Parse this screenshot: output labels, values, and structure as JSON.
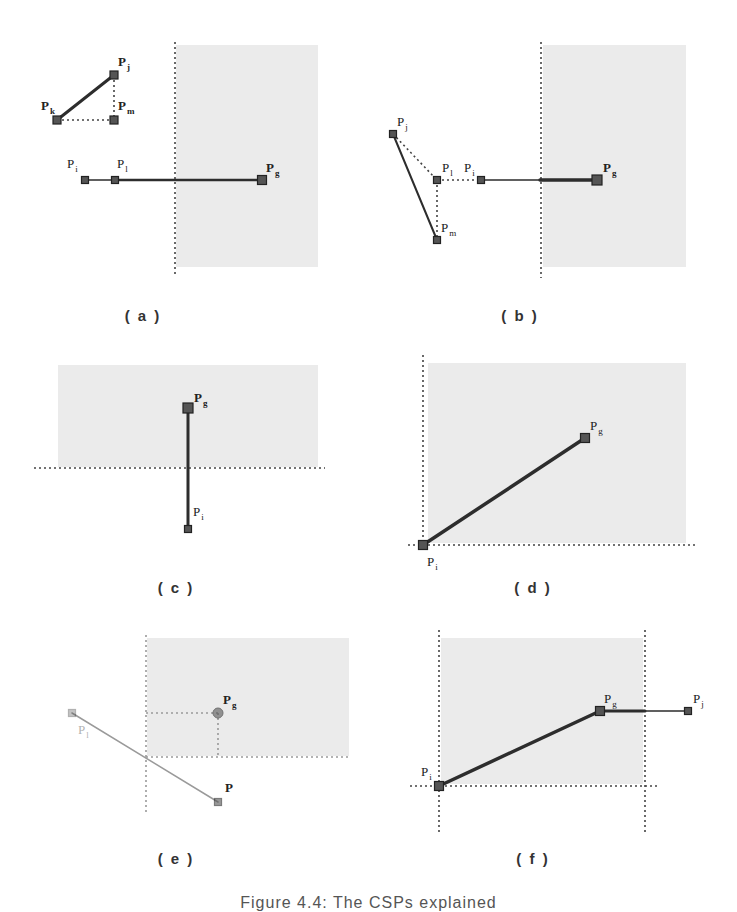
{
  "figure": {
    "caption": "Figure 4.4: The CSPs explained",
    "colors": {
      "region_fill": "#ebebeb",
      "line": "#2d2d2d",
      "point_fill": "#555555",
      "point_stroke": "#222222",
      "dotted": "#444444",
      "faded": "#9a9a9a"
    },
    "panels": [
      {
        "id": "a",
        "label": "( a )",
        "label_pos": [
          143,
          319
        ],
        "regions": [
          {
            "x": 176,
            "y": 45,
            "w": 142,
            "h": 222
          }
        ],
        "dotted_lines": [
          {
            "x1": 175,
            "y1": 42,
            "x2": 175,
            "y2": 275
          },
          {
            "x1": 57,
            "y1": 120,
            "x2": 114,
            "y2": 120
          },
          {
            "x1": 114,
            "y1": 75,
            "x2": 114,
            "y2": 120
          }
        ],
        "solid_lines": [
          {
            "x1": 57,
            "y1": 120,
            "x2": 114,
            "y2": 75,
            "w": 3
          },
          {
            "x1": 85,
            "y1": 180,
            "x2": 115,
            "y2": 180,
            "w": 1.5
          },
          {
            "x1": 115,
            "y1": 180,
            "x2": 262,
            "y2": 180,
            "w": 2.5
          }
        ],
        "points": [
          {
            "name": "Pk",
            "x": 57,
            "y": 120,
            "s": 8,
            "label": "P",
            "sub": "k",
            "lx": 41,
            "ly": 110,
            "bold": true
          },
          {
            "name": "Pj",
            "x": 114,
            "y": 75,
            "s": 8,
            "label": "P",
            "sub": "j",
            "lx": 118,
            "ly": 66,
            "bold": true
          },
          {
            "name": "Pm",
            "x": 114,
            "y": 120,
            "s": 8,
            "label": "P",
            "sub": "m",
            "lx": 118,
            "ly": 110,
            "bold": true
          },
          {
            "name": "Pi",
            "x": 85,
            "y": 180,
            "s": 7,
            "label": "P",
            "sub": "i",
            "lx": 67,
            "ly": 168,
            "bold": false
          },
          {
            "name": "Pl",
            "x": 115,
            "y": 180,
            "s": 7,
            "label": "P",
            "sub": "l",
            "lx": 117,
            "ly": 168,
            "bold": false
          },
          {
            "name": "Pg",
            "x": 262,
            "y": 180,
            "s": 9,
            "label": "P",
            "sub": "g",
            "lx": 266,
            "ly": 172,
            "bold": true
          }
        ]
      },
      {
        "id": "b",
        "label": "( b )",
        "label_pos": [
          520,
          319
        ],
        "regions": [
          {
            "x": 543,
            "y": 45,
            "w": 143,
            "h": 222
          }
        ],
        "dotted_lines": [
          {
            "x1": 541,
            "y1": 42,
            "x2": 541,
            "y2": 278
          },
          {
            "x1": 393,
            "y1": 134,
            "x2": 437,
            "y2": 180
          },
          {
            "x1": 437,
            "y1": 180,
            "x2": 481,
            "y2": 180
          },
          {
            "x1": 437,
            "y1": 180,
            "x2": 437,
            "y2": 240
          }
        ],
        "solid_lines": [
          {
            "x1": 393,
            "y1": 134,
            "x2": 437,
            "y2": 240,
            "w": 2
          },
          {
            "x1": 481,
            "y1": 180,
            "x2": 597,
            "y2": 180,
            "w": 1.5
          },
          {
            "x1": 540,
            "y1": 180,
            "x2": 597,
            "y2": 180,
            "w": 3.5
          }
        ],
        "points": [
          {
            "name": "Pj",
            "x": 393,
            "y": 134,
            "s": 7,
            "label": "P",
            "sub": "j",
            "lx": 397,
            "ly": 126,
            "bold": false
          },
          {
            "name": "Pl",
            "x": 437,
            "y": 180,
            "s": 7,
            "label": "P",
            "sub": "l",
            "lx": 442,
            "ly": 172,
            "bold": false
          },
          {
            "name": "Pi",
            "x": 481,
            "y": 180,
            "s": 7,
            "label": "P",
            "sub": "i",
            "lx": 464,
            "ly": 172,
            "bold": false
          },
          {
            "name": "Pm",
            "x": 437,
            "y": 240,
            "s": 7,
            "label": "P",
            "sub": "m",
            "lx": 441,
            "ly": 232,
            "bold": false
          },
          {
            "name": "Pg",
            "x": 597,
            "y": 180,
            "s": 10,
            "label": "P",
            "sub": "g",
            "lx": 603,
            "ly": 172,
            "bold": true
          }
        ]
      },
      {
        "id": "c",
        "label": "( c )",
        "label_pos": [
          176,
          591
        ],
        "regions": [
          {
            "x": 58,
            "y": 365,
            "w": 260,
            "h": 102
          }
        ],
        "dotted_lines": [
          {
            "x1": 34,
            "y1": 468,
            "x2": 325,
            "y2": 468
          }
        ],
        "solid_lines": [
          {
            "x1": 188,
            "y1": 408,
            "x2": 188,
            "y2": 529,
            "w": 3
          }
        ],
        "points": [
          {
            "name": "Pg",
            "x": 188,
            "y": 408,
            "s": 10,
            "label": "P",
            "sub": "g",
            "lx": 194,
            "ly": 402,
            "bold": true
          },
          {
            "name": "Pi",
            "x": 188,
            "y": 529,
            "s": 7,
            "label": "P",
            "sub": "i",
            "lx": 193,
            "ly": 516,
            "bold": false
          }
        ]
      },
      {
        "id": "d",
        "label": "( d )",
        "label_pos": [
          533,
          591
        ],
        "regions": [
          {
            "x": 428,
            "y": 363,
            "w": 258,
            "h": 180
          }
        ],
        "dotted_lines": [
          {
            "x1": 423,
            "y1": 355,
            "x2": 423,
            "y2": 548
          },
          {
            "x1": 408,
            "y1": 545,
            "x2": 695,
            "y2": 545
          }
        ],
        "solid_lines": [
          {
            "x1": 423,
            "y1": 545,
            "x2": 585,
            "y2": 438,
            "w": 3.5
          }
        ],
        "points": [
          {
            "name": "Pg",
            "x": 585,
            "y": 438,
            "s": 9,
            "label": "P",
            "sub": "g",
            "lx": 590,
            "ly": 430,
            "bold": false
          },
          {
            "name": "Pi",
            "x": 423,
            "y": 545,
            "s": 9,
            "label": "P",
            "sub": "i",
            "lx": 427,
            "ly": 566,
            "bold": false
          }
        ]
      },
      {
        "id": "e",
        "label": "( e )",
        "label_pos": [
          176,
          862
        ],
        "regions": [
          {
            "x": 147,
            "y": 638,
            "w": 202,
            "h": 118
          }
        ],
        "dotted_lines": [
          {
            "x1": 146,
            "y1": 635,
            "x2": 146,
            "y2": 815
          },
          {
            "x1": 146,
            "y1": 757,
            "x2": 350,
            "y2": 757
          },
          {
            "x1": 146,
            "y1": 713,
            "x2": 218,
            "y2": 713
          },
          {
            "x1": 218,
            "y1": 713,
            "x2": 218,
            "y2": 757
          }
        ],
        "solid_lines": [
          {
            "x1": 72,
            "y1": 713,
            "x2": 218,
            "y2": 802,
            "w": 1.5
          }
        ],
        "faded": true,
        "points": [
          {
            "name": "Pl",
            "x": 72,
            "y": 713,
            "s": 7,
            "label": "P",
            "sub": "l",
            "lx": 78,
            "ly": 734,
            "bold": false,
            "faint": true
          },
          {
            "name": "Pg",
            "x": 218,
            "y": 713,
            "s": 8,
            "round": true,
            "label": "P",
            "sub": "g",
            "lx": 223,
            "ly": 704,
            "bold": true
          },
          {
            "name": "P",
            "x": 218,
            "y": 802,
            "s": 7,
            "label": "P",
            "sub": "",
            "lx": 225,
            "ly": 792,
            "bold": true
          }
        ]
      },
      {
        "id": "f",
        "label": "( f )",
        "label_pos": [
          533,
          862
        ],
        "regions": [
          {
            "x": 441,
            "y": 638,
            "w": 202,
            "h": 146
          }
        ],
        "dotted_lines": [
          {
            "x1": 439,
            "y1": 630,
            "x2": 439,
            "y2": 833
          },
          {
            "x1": 645,
            "y1": 630,
            "x2": 645,
            "y2": 833
          },
          {
            "x1": 410,
            "y1": 786,
            "x2": 660,
            "y2": 786
          }
        ],
        "solid_lines": [
          {
            "x1": 439,
            "y1": 786,
            "x2": 600,
            "y2": 711,
            "w": 3.5
          },
          {
            "x1": 600,
            "y1": 711,
            "x2": 688,
            "y2": 711,
            "w": 1.5
          },
          {
            "x1": 600,
            "y1": 711,
            "x2": 645,
            "y2": 711,
            "w": 3
          }
        ],
        "points": [
          {
            "name": "Pi",
            "x": 439,
            "y": 786,
            "s": 9,
            "label": "P",
            "sub": "i",
            "lx": 421,
            "ly": 776,
            "bold": false
          },
          {
            "name": "Pg",
            "x": 600,
            "y": 711,
            "s": 9,
            "label": "P",
            "sub": "g",
            "lx": 604,
            "ly": 703,
            "bold": false
          },
          {
            "name": "Pj",
            "x": 688,
            "y": 711,
            "s": 7,
            "label": "P",
            "sub": "j",
            "lx": 693,
            "ly": 703,
            "bold": false
          }
        ]
      }
    ]
  }
}
